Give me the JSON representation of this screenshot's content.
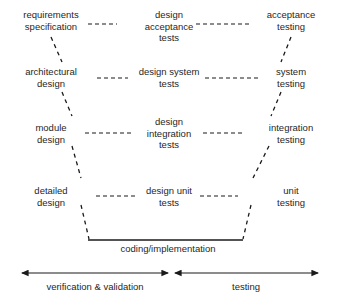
{
  "diagram": {
    "type": "v-model",
    "rows": [
      {
        "left": "requirements\nspecification",
        "middle": "design\nacceptance\ntests",
        "right": "acceptance\ntesting"
      },
      {
        "left": "architectural\ndesign",
        "middle": "design system\ntests",
        "right": "system\ntesting"
      },
      {
        "left": "module\ndesign",
        "middle": "design\nintegration\ntests",
        "right": "integration\ntesting"
      },
      {
        "left": "detailed\ndesign",
        "middle": "design unit\ntests",
        "right": "unit\ntesting"
      }
    ],
    "bottom_label": "coding/implementation",
    "axes": [
      {
        "label": "verification & validation"
      },
      {
        "label": "testing"
      }
    ],
    "colors": {
      "text": "#1f1f1f",
      "line": "#1a1a1a",
      "background": "#ffffff"
    }
  }
}
